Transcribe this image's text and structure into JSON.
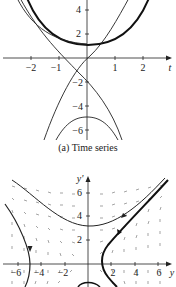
{
  "figure_a": {
    "caption": "(a)  Time series",
    "x_axis_label": "t",
    "x_ticks": [
      "−2",
      "−1",
      "1",
      "2"
    ],
    "y_ticks": [
      "4",
      "2",
      "−2",
      "−4",
      "−6"
    ]
  },
  "figure_b": {
    "y_axis_label": "y'",
    "x_axis_label": "y",
    "x_ticks": [
      "−6",
      "−4",
      "−2",
      "2",
      "4",
      "6"
    ],
    "y_ticks": [
      "6",
      "4",
      "2"
    ]
  },
  "colors": {
    "ink": "#222222",
    "field": "#555555"
  }
}
